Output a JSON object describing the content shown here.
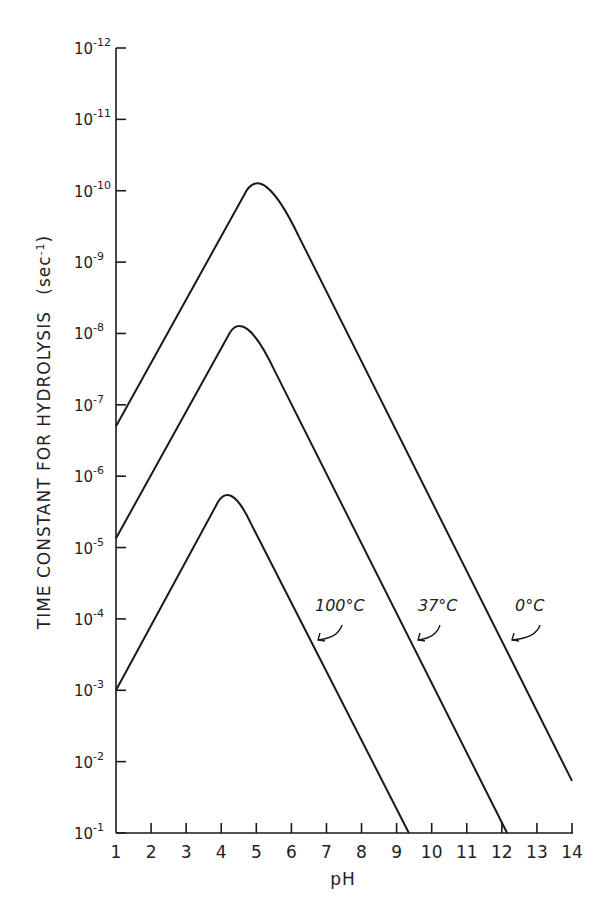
{
  "chart_data": {
    "type": "line",
    "title": "",
    "xlabel": "pH",
    "ylabel": "TIME CONSTANT FOR HYDROLYSIS (sec⁻¹)",
    "ylabel_parts": {
      "main": "TIME CONSTANT FOR HYDROLYSIS",
      "unit": "(sec",
      "unit_sup": "-1",
      "unit_close": ")"
    },
    "xlim": [
      1,
      14
    ],
    "y_scale": "log",
    "y_axis_direction": "inverted (10^-12 at top, 10^-1 at bottom)",
    "y_exponent_range": [
      -12,
      -1
    ],
    "grid": false,
    "legend": "inline labels with arrows",
    "x_ticks": [
      "1",
      "2",
      "3",
      "4",
      "5",
      "6",
      "7",
      "8",
      "9",
      "10",
      "11",
      "12",
      "13",
      "14"
    ],
    "y_ticks": [
      {
        "base": "10",
        "exp": "-12"
      },
      {
        "base": "10",
        "exp": "-11"
      },
      {
        "base": "10",
        "exp": "-10"
      },
      {
        "base": "10",
        "exp": "-9"
      },
      {
        "base": "10",
        "exp": "-8"
      },
      {
        "base": "10",
        "exp": "-7"
      },
      {
        "base": "10",
        "exp": "-6"
      },
      {
        "base": "10",
        "exp": "-5"
      },
      {
        "base": "10",
        "exp": "-4"
      },
      {
        "base": "10",
        "exp": "-3"
      },
      {
        "base": "10",
        "exp": "-2"
      },
      {
        "base": "10",
        "exp": "-1"
      }
    ],
    "series": [
      {
        "name": "0°C",
        "label": "0°C",
        "points_log10": [
          [
            1,
            -6.7
          ],
          [
            5.16,
            -10.39
          ],
          [
            14,
            -1.73
          ]
        ],
        "peak": {
          "pH": 5.16,
          "log10_value": -10.39
        }
      },
      {
        "name": "37°C",
        "label": "37°C",
        "points_log10": [
          [
            1,
            -5.13
          ],
          [
            4.63,
            -8.35
          ],
          [
            12.15,
            -1.0
          ]
        ],
        "peak": {
          "pH": 4.63,
          "log10_value": -8.35
        }
      },
      {
        "name": "100°C",
        "label": "100°C",
        "points_log10": [
          [
            1,
            -3.0
          ],
          [
            4.23,
            -5.93
          ],
          [
            9.35,
            -1.0
          ]
        ],
        "peak": {
          "pH": 4.23,
          "log10_value": -5.93
        }
      }
    ]
  }
}
